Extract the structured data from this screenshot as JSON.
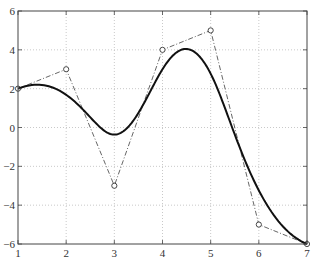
{
  "chart_data": {
    "type": "line",
    "title": "",
    "xlabel": "",
    "ylabel": "",
    "xlim": [
      1,
      7
    ],
    "ylim": [
      -6,
      6
    ],
    "grid": true,
    "x_ticks": [
      1,
      2,
      3,
      4,
      5,
      6,
      7
    ],
    "y_ticks": [
      -6,
      -4,
      -2,
      0,
      2,
      4,
      6
    ],
    "x_tick_labels": [
      "1",
      "2",
      "3",
      "4",
      "5",
      "6",
      "7"
    ],
    "y_tick_labels": [
      "−6",
      "−4",
      "−2",
      "0",
      "2",
      "4",
      "6"
    ],
    "series": [
      {
        "name": "control polygon",
        "style": "dash-dot with circle markers",
        "color": "#555555",
        "x": [
          1,
          2,
          3,
          4,
          5,
          6,
          7
        ],
        "y": [
          2,
          3,
          -3,
          4,
          5,
          -5,
          -6
        ]
      },
      {
        "name": "spline curve",
        "style": "solid thick",
        "color": "#111111",
        "description": "clamped cubic B-spline of the control points",
        "sample_points": [
          {
            "x": 1.0,
            "y": 2.0
          },
          {
            "x": 1.5,
            "y": 2.2
          },
          {
            "x": 2.0,
            "y": 1.8
          },
          {
            "x": 2.5,
            "y": 0.6
          },
          {
            "x": 3.0,
            "y": -0.8
          },
          {
            "x": 3.5,
            "y": 0.8
          },
          {
            "x": 4.0,
            "y": 3.3
          },
          {
            "x": 4.45,
            "y": 3.9
          },
          {
            "x": 5.0,
            "y": 2.4
          },
          {
            "x": 5.5,
            "y": -0.6
          },
          {
            "x": 6.0,
            "y": -3.2
          },
          {
            "x": 6.5,
            "y": -5.0
          },
          {
            "x": 7.0,
            "y": -6.0
          }
        ]
      }
    ]
  },
  "colors": {
    "axis": "#444444",
    "grid": "#bbbbbb",
    "curve": "#111111",
    "polygon": "#555555"
  }
}
